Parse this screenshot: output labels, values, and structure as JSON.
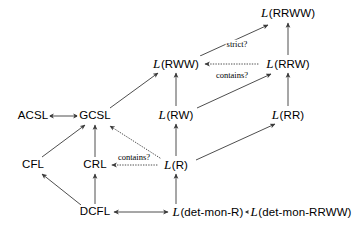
{
  "figure": {
    "type": "hierarchy-diagram",
    "background_color": "#ffffff",
    "line_color": "#3a3a3a",
    "text_color": "#000000",
    "width": 363,
    "height": 230
  },
  "nodes": [
    {
      "id": "acsl",
      "label": "ACSL",
      "calligraphic": false,
      "x": 33,
      "y": 116
    },
    {
      "id": "gcsl",
      "label": "GCSL",
      "calligraphic": false,
      "x": 95,
      "y": 116
    },
    {
      "id": "cfl",
      "label": "CFL",
      "calligraphic": false,
      "x": 33,
      "y": 165
    },
    {
      "id": "crl",
      "label": "CRL",
      "calligraphic": false,
      "x": 95,
      "y": 165
    },
    {
      "id": "dcfl",
      "label": "DCFL",
      "calligraphic": false,
      "x": 95,
      "y": 212
    },
    {
      "id": "l_r",
      "label": "(R)",
      "calligraphic": true,
      "x": 176,
      "y": 165
    },
    {
      "id": "l_rw",
      "label": "(RW)",
      "calligraphic": true,
      "x": 176,
      "y": 115
    },
    {
      "id": "l_rww",
      "label": "(RWW)",
      "calligraphic": true,
      "x": 176,
      "y": 64
    },
    {
      "id": "l_rr",
      "label": "(RR)",
      "calligraphic": true,
      "x": 288,
      "y": 115
    },
    {
      "id": "l_rrw",
      "label": "(RRW)",
      "calligraphic": true,
      "x": 288,
      "y": 64
    },
    {
      "id": "l_rrww",
      "label": "(RRWW)",
      "calligraphic": true,
      "x": 288,
      "y": 13
    },
    {
      "id": "l_dmr",
      "label": "(det-mon-R)",
      "calligraphic": true,
      "x": 208,
      "y": 212
    },
    {
      "id": "l_dmrrww",
      "label": "(det-mon-RRWW)",
      "calligraphic": true,
      "x": 301,
      "y": 212
    }
  ],
  "edges": [
    {
      "id": "acsl-gcsl",
      "from": "acsl",
      "to": "gcsl",
      "style": "solid",
      "arrows": "both",
      "x1": 49,
      "y1": 116,
      "x2": 78,
      "y2": 116
    },
    {
      "id": "cfl-gcsl",
      "from": "cfl",
      "to": "gcsl",
      "style": "solid",
      "arrows": "forward",
      "x1": 42,
      "y1": 157,
      "x2": 85,
      "y2": 125
    },
    {
      "id": "crl-gcsl",
      "from": "crl",
      "to": "gcsl",
      "style": "solid",
      "arrows": "forward",
      "x1": 95,
      "y1": 157,
      "x2": 95,
      "y2": 125
    },
    {
      "id": "dcfl-cfl",
      "from": "dcfl",
      "to": "cfl",
      "style": "solid",
      "arrows": "forward",
      "x1": 81,
      "y1": 205,
      "x2": 42,
      "y2": 174
    },
    {
      "id": "dcfl-crl",
      "from": "dcfl",
      "to": "crl",
      "style": "solid",
      "arrows": "forward",
      "x1": 95,
      "y1": 204,
      "x2": 95,
      "y2": 174
    },
    {
      "id": "dcfl-ldmr",
      "from": "dcfl",
      "to": "l_dmr",
      "style": "solid",
      "arrows": "both",
      "x1": 114,
      "y1": 212,
      "x2": 168,
      "y2": 212
    },
    {
      "id": "ldmr-ldmrrww",
      "from": "l_dmr",
      "to": "l_dmrrww",
      "style": "solid",
      "arrows": "both",
      "x1": 245,
      "y1": 212,
      "x2": 255,
      "y2": 212
    },
    {
      "id": "ldmr-lr",
      "from": "l_dmr",
      "to": "l_r",
      "style": "solid",
      "arrows": "forward",
      "x1": 176,
      "y1": 204,
      "x2": 176,
      "y2": 174
    },
    {
      "id": "lr-lrw",
      "from": "l_r",
      "to": "l_rw",
      "style": "solid",
      "arrows": "forward",
      "x1": 176,
      "y1": 156,
      "x2": 176,
      "y2": 124
    },
    {
      "id": "lrw-lrww",
      "from": "l_rw",
      "to": "l_rww",
      "style": "solid",
      "arrows": "forward",
      "x1": 176,
      "y1": 106,
      "x2": 176,
      "y2": 73
    },
    {
      "id": "lr-lrr",
      "from": "l_r",
      "to": "l_rr",
      "style": "solid",
      "arrows": "forward",
      "x1": 196,
      "y1": 160,
      "x2": 275,
      "y2": 124
    },
    {
      "id": "lrw-lrrw",
      "from": "l_rw",
      "to": "l_rrw",
      "style": "solid",
      "arrows": "forward",
      "x1": 197,
      "y1": 108,
      "x2": 271,
      "y2": 74
    },
    {
      "id": "lrr-lrrw",
      "from": "l_rr",
      "to": "l_rrw",
      "style": "solid",
      "arrows": "forward",
      "x1": 288,
      "y1": 106,
      "x2": 288,
      "y2": 73
    },
    {
      "id": "lrrw-lrrww",
      "from": "l_rrw",
      "to": "l_rrww",
      "style": "solid",
      "arrows": "forward",
      "x1": 288,
      "y1": 55,
      "x2": 288,
      "y2": 23
    },
    {
      "id": "lrww-lrrww",
      "from": "l_rww",
      "to": "l_rrww",
      "style": "solid",
      "arrows": "forward",
      "x1": 200,
      "y1": 56,
      "x2": 268,
      "y2": 25
    },
    {
      "id": "gcsl-lrww",
      "from": "gcsl",
      "to": "l_rww",
      "style": "solid",
      "arrows": "forward",
      "x1": 110,
      "y1": 108,
      "x2": 158,
      "y2": 73
    },
    {
      "id": "lrrw-lrww",
      "from": "l_rrw",
      "to": "l_rww",
      "style": "dotted",
      "arrows": "forward",
      "x1": 258,
      "y1": 64,
      "x2": 205,
      "y2": 64
    },
    {
      "id": "lr-crl",
      "from": "l_r",
      "to": "crl",
      "style": "dotted",
      "arrows": "forward",
      "x1": 157,
      "y1": 165,
      "x2": 112,
      "y2": 165
    },
    {
      "id": "lr-gcsl",
      "from": "l_r",
      "to": "gcsl",
      "style": "dotted",
      "arrows": "forward",
      "x1": 160,
      "y1": 158,
      "x2": 110,
      "y2": 126
    }
  ],
  "edge_labels": [
    {
      "id": "strict-label",
      "text": "strict?",
      "x": 237,
      "y": 44,
      "for_edge": "lrww-lrrww"
    },
    {
      "id": "contains-top-label",
      "text": "contains?",
      "x": 232,
      "y": 75,
      "for_edge": "lrrw-lrww"
    },
    {
      "id": "contains-left-label",
      "text": "contains?",
      "x": 134,
      "y": 157,
      "for_edge": "lr-crl"
    }
  ]
}
